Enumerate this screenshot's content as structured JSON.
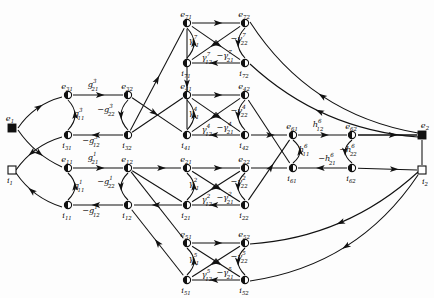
{
  "figure": {
    "type": "signal-flow-graph",
    "title": "",
    "node_shapes": {
      "e_terminal": "filled-square",
      "i_terminal": "open-square",
      "e_node": "half-filled-circle",
      "i_node": "half-filled-circle"
    }
  },
  "terminals": {
    "left_e": {
      "id": "e1",
      "base": "e",
      "sub": "1",
      "x": 12,
      "y": 128,
      "shape": "filled-square"
    },
    "left_i": {
      "id": "i1",
      "base": "i",
      "sub": "1",
      "x": 12,
      "y": 170,
      "shape": "open-square"
    },
    "right_e": {
      "id": "e2",
      "base": "e",
      "sub": "2",
      "x": 422,
      "y": 135,
      "shape": "filled-square"
    },
    "right_i": {
      "id": "i2",
      "base": "i",
      "sub": "2",
      "x": 422,
      "y": 170,
      "shape": "open-square"
    }
  },
  "blocks": [
    {
      "index": 1,
      "symbol": "g",
      "nodes": [
        {
          "id": "e11",
          "base": "e",
          "sub": "11",
          "x": 68,
          "y": 168
        },
        {
          "id": "e12",
          "base": "e",
          "sub": "12",
          "x": 128,
          "y": 168
        },
        {
          "id": "i11",
          "base": "i",
          "sub": "11",
          "x": 68,
          "y": 205
        },
        {
          "id": "i12",
          "base": "i",
          "sub": "12",
          "x": 128,
          "y": 205
        }
      ],
      "labels": [
        {
          "text": "g",
          "sub": "21",
          "sup": "1",
          "neg": false,
          "x": 93,
          "y": 160
        },
        {
          "text": "g",
          "sub": "11",
          "sup": "1",
          "neg": false,
          "x": 79,
          "y": 188
        },
        {
          "text": "g",
          "sub": "22",
          "sup": "1",
          "neg": true,
          "x": 106,
          "y": 184
        },
        {
          "text": "g",
          "sub": "12",
          "sup": "1",
          "neg": true,
          "x": 91,
          "y": 213
        }
      ]
    },
    {
      "index": 3,
      "symbol": "g",
      "nodes": [
        {
          "id": "e31",
          "base": "e",
          "sub": "31",
          "x": 68,
          "y": 95
        },
        {
          "id": "e32",
          "base": "e",
          "sub": "32",
          "x": 128,
          "y": 95
        },
        {
          "id": "i31",
          "base": "i",
          "sub": "31",
          "x": 68,
          "y": 135
        },
        {
          "id": "i32",
          "base": "i",
          "sub": "32",
          "x": 128,
          "y": 135
        }
      ],
      "labels": [
        {
          "text": "g",
          "sub": "21",
          "sup": "3",
          "neg": false,
          "x": 93,
          "y": 87
        },
        {
          "text": "g",
          "sub": "11",
          "sup": "3",
          "neg": false,
          "x": 79,
          "y": 116
        },
        {
          "text": "g",
          "sub": "22",
          "sup": "3",
          "neg": true,
          "x": 106,
          "y": 112
        },
        {
          "text": "g",
          "sub": "12",
          "sup": "3",
          "neg": true,
          "x": 91,
          "y": 143
        }
      ]
    },
    {
      "index": 7,
      "symbol": "γ",
      "nodes": [
        {
          "id": "e71",
          "base": "e",
          "sub": "71",
          "x": 187,
          "y": 23
        },
        {
          "id": "e72",
          "base": "e",
          "sub": "72",
          "x": 245,
          "y": 23
        },
        {
          "id": "i71",
          "base": "i",
          "sub": "71",
          "x": 187,
          "y": 63
        },
        {
          "id": "i72",
          "base": "i",
          "sub": "72",
          "x": 245,
          "y": 63
        }
      ],
      "labels": [
        {
          "text": "γ",
          "sub": "11",
          "sup": "7",
          "neg": false,
          "x": 194,
          "y": 43
        },
        {
          "text": "γ",
          "sub": "12",
          "sup": "7",
          "neg": false,
          "x": 207,
          "y": 60
        },
        {
          "text": "γ",
          "sub": "21",
          "sup": "7",
          "neg": true,
          "x": 225,
          "y": 58
        },
        {
          "text": "γ",
          "sub": "22",
          "sup": "7",
          "neg": true,
          "x": 239,
          "y": 41
        }
      ]
    },
    {
      "index": 4,
      "symbol": "γ",
      "nodes": [
        {
          "id": "e41",
          "base": "e",
          "sub": "41",
          "x": 187,
          "y": 95
        },
        {
          "id": "e42",
          "base": "e",
          "sub": "42",
          "x": 245,
          "y": 95
        },
        {
          "id": "i41",
          "base": "i",
          "sub": "41",
          "x": 187,
          "y": 135
        },
        {
          "id": "i42",
          "base": "i",
          "sub": "42",
          "x": 245,
          "y": 135
        }
      ],
      "labels": [
        {
          "text": "γ",
          "sub": "11",
          "sup": "4",
          "neg": false,
          "x": 194,
          "y": 115
        },
        {
          "text": "γ",
          "sub": "12",
          "sup": "4",
          "neg": false,
          "x": 207,
          "y": 132
        },
        {
          "text": "γ",
          "sub": "21",
          "sup": "4",
          "neg": true,
          "x": 225,
          "y": 130
        },
        {
          "text": "γ",
          "sub": "22",
          "sup": "4",
          "neg": true,
          "x": 239,
          "y": 113
        }
      ]
    },
    {
      "index": 2,
      "symbol": "γ",
      "nodes": [
        {
          "id": "e21",
          "base": "e",
          "sub": "21",
          "x": 187,
          "y": 168
        },
        {
          "id": "e22",
          "base": "e",
          "sub": "22",
          "x": 245,
          "y": 168
        },
        {
          "id": "i21",
          "base": "i",
          "sub": "21",
          "x": 187,
          "y": 205
        },
        {
          "id": "i22",
          "base": "i",
          "sub": "22",
          "x": 245,
          "y": 205
        }
      ],
      "labels": [
        {
          "text": "γ",
          "sub": "11",
          "sup": "2",
          "neg": false,
          "x": 194,
          "y": 186
        },
        {
          "text": "γ",
          "sub": "12",
          "sup": "2",
          "neg": false,
          "x": 207,
          "y": 202
        },
        {
          "text": "γ",
          "sub": "21",
          "sup": "2",
          "neg": true,
          "x": 225,
          "y": 200
        },
        {
          "text": "γ",
          "sub": "22",
          "sup": "2",
          "neg": true,
          "x": 239,
          "y": 184
        }
      ]
    },
    {
      "index": 5,
      "symbol": "γ",
      "nodes": [
        {
          "id": "e51",
          "base": "e",
          "sub": "51",
          "x": 187,
          "y": 243
        },
        {
          "id": "e52",
          "base": "e",
          "sub": "52",
          "x": 245,
          "y": 243
        },
        {
          "id": "i51",
          "base": "i",
          "sub": "51",
          "x": 187,
          "y": 280
        },
        {
          "id": "i52",
          "base": "i",
          "sub": "52",
          "x": 245,
          "y": 280
        }
      ],
      "labels": [
        {
          "text": "γ",
          "sub": "11",
          "sup": "5",
          "neg": false,
          "x": 194,
          "y": 261
        },
        {
          "text": "γ",
          "sub": "12",
          "sup": "5",
          "neg": false,
          "x": 207,
          "y": 277
        },
        {
          "text": "γ",
          "sub": "21",
          "sup": "5",
          "neg": true,
          "x": 225,
          "y": 275
        },
        {
          "text": "γ",
          "sub": "22",
          "sup": "5",
          "neg": true,
          "x": 239,
          "y": 259
        }
      ]
    },
    {
      "index": 6,
      "symbol": "h",
      "nodes": [
        {
          "id": "e61",
          "base": "e",
          "sub": "61",
          "x": 293,
          "y": 135
        },
        {
          "id": "e62",
          "base": "e",
          "sub": "62",
          "x": 352,
          "y": 135
        },
        {
          "id": "i61",
          "base": "i",
          "sub": "61",
          "x": 293,
          "y": 168
        },
        {
          "id": "i62",
          "base": "i",
          "sub": "62",
          "x": 352,
          "y": 168
        }
      ],
      "labels": [
        {
          "text": "h",
          "sub": "12",
          "sup": "6",
          "neg": false,
          "x": 318,
          "y": 127
        },
        {
          "text": "h",
          "sub": "11",
          "sup": "6",
          "neg": false,
          "x": 304,
          "y": 152
        },
        {
          "text": "h",
          "sub": "21",
          "sup": "6",
          "neg": true,
          "x": 327,
          "y": 161
        },
        {
          "text": "h",
          "sub": "22",
          "sup": "6",
          "neg": true,
          "x": 348,
          "y": 152
        }
      ]
    }
  ],
  "node_labels": {
    "e1": "e",
    "i1": "i",
    "e2": "e",
    "i2": "i"
  },
  "colors": {
    "ink": "#111111",
    "background": "#fdfdfd"
  }
}
